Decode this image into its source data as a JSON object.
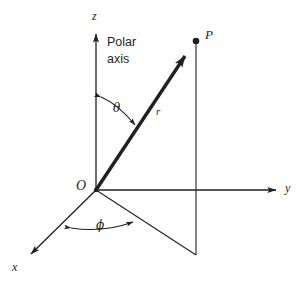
{
  "figure": {
    "background": "#ffffff",
    "ink_color": "#231f20",
    "width": 299,
    "height": 285
  },
  "labels": {
    "z_axis": "z",
    "y_axis": "y",
    "x_axis": "x",
    "origin": "O",
    "point": "P",
    "radius": "r",
    "theta": "θ",
    "phi": "ϕ",
    "polar_axis_line1": "Polar",
    "polar_axis_line2": "axis"
  },
  "geometry": {
    "origin": {
      "x": 96,
      "y": 190
    },
    "point_P": {
      "x": 196,
      "y": 41
    },
    "z_axis_tip": {
      "x": 96,
      "y": 30
    },
    "y_axis_tip": {
      "x": 281,
      "y": 190
    },
    "x_axis_tip": {
      "x": 27,
      "y": 258
    },
    "projection_vertex": {
      "x": 196,
      "y": 255
    },
    "vector_label": "r",
    "angle_theta_between": "z-axis and r",
    "angle_phi_between": "x-axis and projection of r"
  }
}
